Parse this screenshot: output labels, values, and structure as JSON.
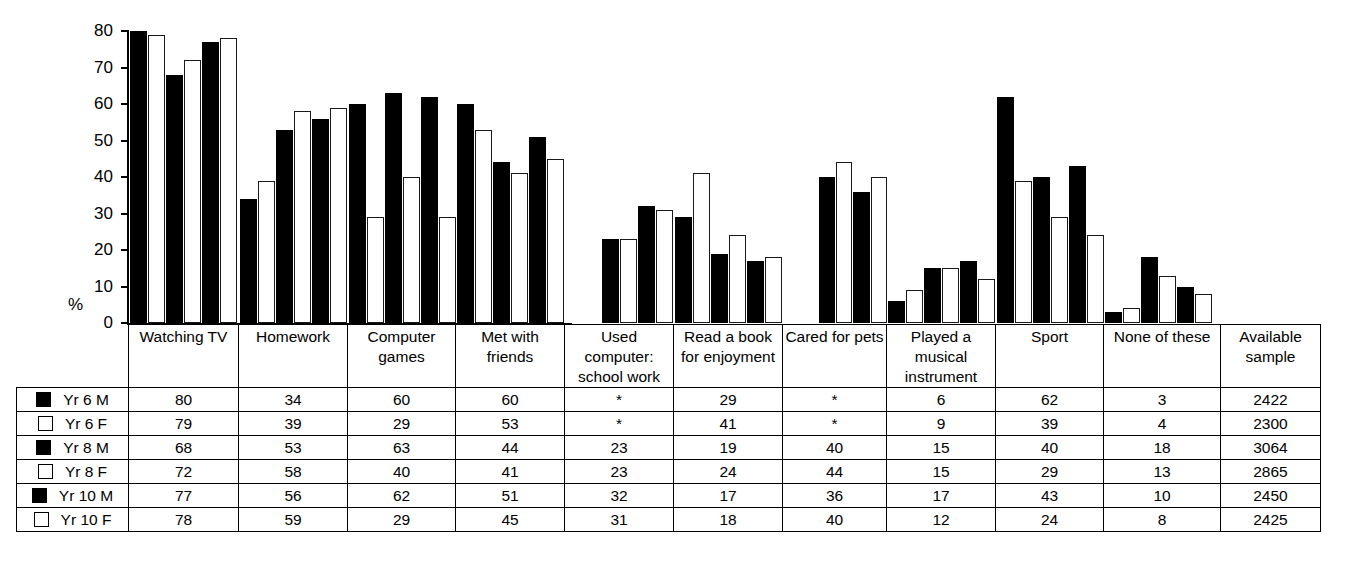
{
  "axis": {
    "y_label": "%",
    "ticks": [
      80,
      70,
      60,
      50,
      40,
      30,
      20,
      10,
      0
    ]
  },
  "table": {
    "sample_header": "Available sample",
    "category_headers": [
      "Watching TV",
      "Homework",
      "Computer games",
      "Met with friends",
      "Used computer: school work",
      "Read a book for enjoyment",
      "Cared for pets",
      "Played a musical instrument",
      "Sport",
      "None of these"
    ],
    "rows": [
      {
        "label": "Yr 6 M",
        "swatch": "filled",
        "values": [
          "80",
          "34",
          "60",
          "60",
          "*",
          "29",
          "*",
          "6",
          "62",
          "3"
        ],
        "sample": "2422"
      },
      {
        "label": "Yr 6 F",
        "swatch": "hollow",
        "values": [
          "79",
          "39",
          "29",
          "53",
          "*",
          "41",
          "*",
          "9",
          "39",
          "4"
        ],
        "sample": "2300"
      },
      {
        "label": "Yr 8 M",
        "swatch": "filled",
        "values": [
          "68",
          "53",
          "63",
          "44",
          "23",
          "19",
          "40",
          "15",
          "40",
          "18"
        ],
        "sample": "3064"
      },
      {
        "label": "Yr 8 F",
        "swatch": "hollow",
        "values": [
          "72",
          "58",
          "40",
          "41",
          "23",
          "24",
          "44",
          "15",
          "29",
          "13"
        ],
        "sample": "2865"
      },
      {
        "label": "Yr 10 M",
        "swatch": "filled",
        "values": [
          "77",
          "56",
          "62",
          "51",
          "32",
          "17",
          "36",
          "17",
          "43",
          "10"
        ],
        "sample": "2450"
      },
      {
        "label": "Yr 10 F",
        "swatch": "hollow",
        "values": [
          "78",
          "59",
          "29",
          "45",
          "31",
          "18",
          "40",
          "12",
          "24",
          "8"
        ],
        "sample": "2425"
      }
    ]
  },
  "chart_data": {
    "type": "bar",
    "title": "",
    "xlabel": "",
    "ylabel": "%",
    "ylim": [
      0,
      80
    ],
    "yticks": [
      0,
      10,
      20,
      30,
      40,
      50,
      60,
      70,
      80
    ],
    "grid": false,
    "legend_position": "table-left",
    "categories": [
      "Watching TV",
      "Homework",
      "Computer games",
      "Met with friends",
      "Used computer: school work",
      "Read a book for enjoyment",
      "Cared for pets",
      "Played a musical instrument",
      "Sport",
      "None of these"
    ],
    "series": [
      {
        "name": "Yr 6 M",
        "style": "filled",
        "values": [
          80,
          34,
          60,
          60,
          null,
          29,
          null,
          6,
          62,
          3
        ]
      },
      {
        "name": "Yr 6 F",
        "style": "hollow",
        "values": [
          79,
          39,
          29,
          53,
          null,
          41,
          null,
          9,
          39,
          4
        ]
      },
      {
        "name": "Yr 8 M",
        "style": "filled",
        "values": [
          68,
          53,
          63,
          44,
          23,
          19,
          40,
          15,
          40,
          18
        ]
      },
      {
        "name": "Yr 8 F",
        "style": "hollow",
        "values": [
          72,
          58,
          40,
          41,
          23,
          24,
          44,
          15,
          29,
          13
        ]
      },
      {
        "name": "Yr 10 M",
        "style": "filled",
        "values": [
          77,
          56,
          62,
          51,
          32,
          17,
          36,
          17,
          43,
          10
        ]
      },
      {
        "name": "Yr 10 F",
        "style": "hollow",
        "values": [
          78,
          59,
          29,
          45,
          31,
          18,
          40,
          12,
          24,
          8
        ]
      }
    ],
    "colors": {
      "filled": "#000000",
      "hollow": "#ffffff",
      "outline": "#000000"
    }
  }
}
